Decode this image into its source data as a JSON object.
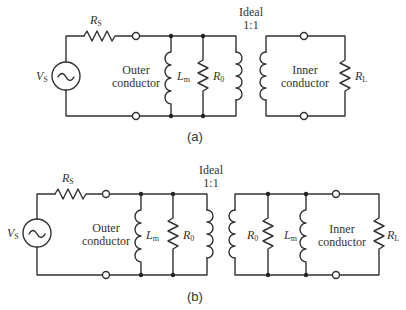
{
  "diagram_a": {
    "caption": "(a)",
    "transformer": {
      "line1": "Ideal",
      "line2": "1:1"
    },
    "source": {
      "symbol": "V",
      "sub": "S",
      "icon": "ac-source-icon"
    },
    "source_resistor": {
      "symbol": "R",
      "sub": "S"
    },
    "outer_label": {
      "line1": "Outer",
      "line2": "conductor"
    },
    "inner_label": {
      "line1": "Inner",
      "line2": "conductor"
    },
    "magnetizing_inductor": {
      "symbol": "L",
      "sub": "m"
    },
    "loss_resistor": {
      "symbol": "R",
      "sub": "0"
    },
    "load_resistor": {
      "symbol": "R",
      "sub": "L"
    }
  },
  "diagram_b": {
    "caption": "(b)",
    "transformer": {
      "line1": "Ideal",
      "line2": "1:1"
    },
    "source": {
      "symbol": "V",
      "sub": "S",
      "icon": "ac-source-icon"
    },
    "source_resistor": {
      "symbol": "R",
      "sub": "S"
    },
    "outer_label": {
      "line1": "Outer",
      "line2": "conductor"
    },
    "inner_label": {
      "line1": "Inner",
      "line2": "conductor"
    },
    "primary_inductor": {
      "symbol": "L",
      "sub": "m"
    },
    "primary_resistor": {
      "symbol": "R",
      "sub": "0"
    },
    "secondary_resistor": {
      "symbol": "R",
      "sub": "0"
    },
    "secondary_inductor": {
      "symbol": "L",
      "sub": "m"
    },
    "load_resistor": {
      "symbol": "R",
      "sub": "L"
    }
  }
}
